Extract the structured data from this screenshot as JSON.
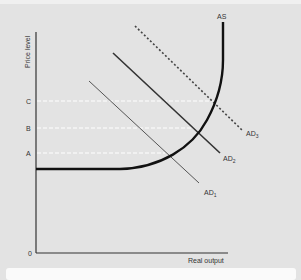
{
  "diagram": {
    "y_axis_label": "Price level",
    "x_axis_label": "Real output",
    "origin_label": "0",
    "price_levels": [
      {
        "label": "C"
      },
      {
        "label": "B"
      },
      {
        "label": "A"
      }
    ],
    "curves": {
      "as": {
        "label": "AS"
      },
      "ad1": {
        "label": "AD",
        "sub": "1"
      },
      "ad2": {
        "label": "AD",
        "sub": "2"
      },
      "ad3": {
        "label": "AD",
        "sub": "3"
      }
    },
    "colors": {
      "axis": "#333333",
      "as_curve": "#111111",
      "ad_curve": "#444444",
      "guide": "#ffffff"
    }
  }
}
